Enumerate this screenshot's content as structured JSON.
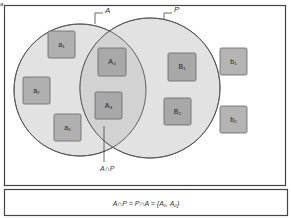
{
  "diagram": {
    "title_marker": "a",
    "sets": [
      {
        "name": "A",
        "label": "A",
        "cx": 80,
        "cy": 90,
        "r": 66,
        "fill": "#e2e2e2",
        "stroke": "#555555"
      },
      {
        "name": "P",
        "label": "P",
        "cx": 150,
        "cy": 88,
        "r": 70,
        "fill": "#e2e2e2",
        "stroke": "#555555"
      }
    ],
    "intersection_fill": "#cfcfcf",
    "intersection_label": "A∩P",
    "elements": [
      {
        "id": "a1",
        "label": "a₁",
        "x": 48,
        "y": 31,
        "set": "A only",
        "fill": "#b0b0b0"
      },
      {
        "id": "a2",
        "label": "a₂",
        "x": 23,
        "y": 77,
        "set": "A only",
        "fill": "#b0b0b0"
      },
      {
        "id": "a3",
        "label": "a₃",
        "x": 54,
        "y": 114,
        "set": "A only",
        "fill": "#b0b0b0"
      },
      {
        "id": "A4",
        "label": "A₄",
        "x": 98,
        "y": 48,
        "set": "A∩P",
        "fill": "#a8a8a8"
      },
      {
        "id": "A3",
        "label": "A₃",
        "x": 95,
        "y": 92,
        "set": "A∩P",
        "fill": "#a8a8a8"
      },
      {
        "id": "B1",
        "label": "B₁",
        "x": 168,
        "y": 53,
        "set": "P only",
        "fill": "#a8a8a8"
      },
      {
        "id": "B2",
        "label": "B₂",
        "x": 164,
        "y": 98,
        "set": "P only",
        "fill": "#a8a8a8"
      },
      {
        "id": "b1",
        "label": "b₁",
        "x": 220,
        "y": 48,
        "set": "outside",
        "fill": "#b4b4b4"
      },
      {
        "id": "b2",
        "label": "b₂",
        "x": 220,
        "y": 106,
        "set": "outside",
        "fill": "#b4b4b4"
      }
    ],
    "formula": "A∩P = P∩A = {A₁, A₂}"
  }
}
